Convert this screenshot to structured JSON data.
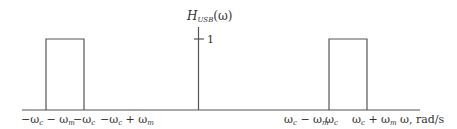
{
  "diagram": {
    "y_label_main": "H",
    "y_label_sub": "USB",
    "y_label_arg": "(ω)",
    "y_tick_label": "1",
    "x_axis_label": "ω, rad/s",
    "x_tick_labels": [
      {
        "id": "neg-wc-minus-wm",
        "text": "−ωc − ωm"
      },
      {
        "id": "neg-wc",
        "text": "−ωc"
      },
      {
        "id": "neg-wc-plus-wm",
        "text": "−ωc + ωm"
      },
      {
        "id": "wc-minus-wm",
        "text": "ωc − ωm"
      },
      {
        "id": "wc",
        "text": "ωc"
      },
      {
        "id": "wc-plus-wm",
        "text": "ωc + ωm"
      }
    ],
    "passbands": [
      {
        "from": "−ωc − ωm",
        "to": "−ωc",
        "height": 1
      },
      {
        "from": "ωc",
        "to": "ωc + ωm",
        "height": 1
      }
    ],
    "line_color": "#555555",
    "text_color": "#333333"
  }
}
